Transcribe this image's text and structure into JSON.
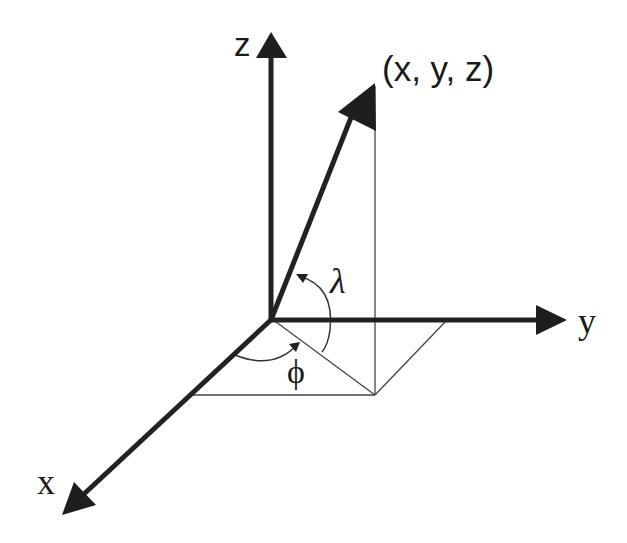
{
  "figure": {
    "axes": [
      {
        "id": "x",
        "label": "x"
      },
      {
        "id": "y",
        "label": "y"
      },
      {
        "id": "z",
        "label": "z"
      }
    ],
    "point_label": "(x, y, z)",
    "angles": [
      {
        "id": "lambda",
        "label": "λ",
        "meaning": "elevation from xy-plane"
      },
      {
        "id": "phi",
        "label": "ϕ",
        "meaning": "azimuth from x-axis"
      }
    ],
    "colors": {
      "axis": "#222222",
      "guide_lines": "#444444",
      "background": "#ffffff"
    }
  }
}
